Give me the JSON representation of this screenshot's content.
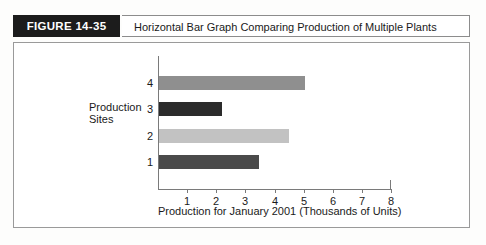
{
  "figure": {
    "number_label": "FIGURE 14-35",
    "title": "Horizontal Bar Graph Comparing Production of Multiple Plants"
  },
  "colors": {
    "label_box_bg": "#1c1c1c",
    "label_box_text": "#ffffff",
    "frame_border": "#9a9a9a",
    "axis": "#7a7a7a",
    "bar_1": "#4a4a4a",
    "bar_2": "#c2c2c2",
    "bar_3": "#2b2b2b",
    "bar_4": "#8f8f8f"
  },
  "chart_data": {
    "type": "bar",
    "orientation": "horizontal",
    "title": "",
    "xlabel": "Production for January 2001 (Thousands of Units)",
    "ylabel_line1": "Production",
    "ylabel_line2": "Sites",
    "categories": [
      "1",
      "2",
      "3",
      "4"
    ],
    "values": [
      3.45,
      4.45,
      2.15,
      5.0
    ],
    "bar_colors": [
      "#4a4a4a",
      "#c2c2c2",
      "#2b2b2b",
      "#8f8f8f"
    ],
    "xlim": [
      0,
      8
    ],
    "xticks": [
      1,
      2,
      3,
      4,
      5,
      6,
      7,
      8
    ],
    "xtick_labels": [
      "1",
      "2",
      "3",
      "4",
      "5",
      "6",
      "7",
      "8"
    ],
    "grid": false,
    "legend": false
  }
}
